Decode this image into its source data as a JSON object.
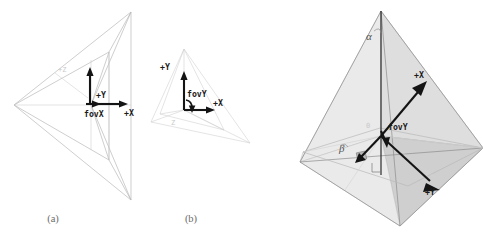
{
  "figure": {
    "background_color": "#ffffff",
    "line_color": "#b9b9b9",
    "arrow_color": "#141414",
    "caption_color": "#6b6b6b",
    "panels": [
      {
        "id": "a",
        "caption": "(a)",
        "description": "Side view of a view frustum pyramid with apex at left and rectangular far plane at right, showing the horizontal field of view angle.",
        "labels": {
          "axis_y": "+Y",
          "axis_x": "+X",
          "fov": "fovX",
          "axis_z_faint": "+Z"
        }
      },
      {
        "id": "b",
        "caption": "(b)",
        "description": "Perspective view of a view frustum showing the vertical field of view angle at the origin.",
        "labels": {
          "axis_y": "+Y",
          "axis_x": "+X",
          "fov": "fovY",
          "axis_z_faint": "Z"
        }
      },
      {
        "id": "c",
        "caption": "",
        "description": "Three-dimensional shaded pyramid with vertical axis and ground plane showing alpha and beta angles plus the camera X and Y axes.",
        "labels": {
          "angle_alpha": "α",
          "angle_beta": "β",
          "axis_x": "+X",
          "axis_y": "+Y",
          "fov": "fovY",
          "origin_faint": "0"
        }
      }
    ]
  }
}
